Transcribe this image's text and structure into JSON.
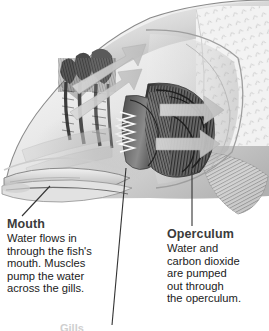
{
  "figure": {
    "background_color": "#ffffff",
    "width": 269,
    "height": 331
  },
  "illustration": {
    "description": "Grayscale cutaway drawing of a fish head showing the mouth, gill arches with filaments, operculum and pectoral fin, with pale arrows tracing water flow from the mouth across the gills and out behind the operculum.",
    "palette": {
      "outline": "#5e5e5e",
      "body_light": "#e9e9e9",
      "body_mid": "#b4b4b4",
      "body_shadow": "#6e6e6e",
      "gill_dark": "#3a3a3a",
      "gill_mid": "#7a7a7a",
      "arrow_fill": "#c9c9c9",
      "arrow_edge": "#a8a8a8",
      "leader_line": "#3c3c3c"
    },
    "parts": [
      "head-outline",
      "mouth-opening",
      "lower-jaw",
      "gill-rakers",
      "gill-arch-anterior",
      "gill-arch-posterior",
      "gill-filaments",
      "operculum-edge",
      "scale-texture",
      "pectoral-fin"
    ],
    "flow_arrows": [
      {
        "name": "inflow-arrow-upper",
        "direction": "up-right"
      },
      {
        "name": "inflow-arrow-lower",
        "direction": "up-right"
      },
      {
        "name": "across-gills-arrow",
        "direction": "right"
      },
      {
        "name": "outflow-arrow-upper",
        "direction": "right"
      },
      {
        "name": "outflow-arrow-lower",
        "direction": "right"
      }
    ]
  },
  "callouts": [
    {
      "id": "mouth",
      "title": "Mouth",
      "lines": [
        "Water flows in",
        "through the fish's",
        "mouth. Muscles",
        "pump the water",
        "across the gills."
      ]
    },
    {
      "id": "operculum",
      "title": "Operculum",
      "lines": [
        "Water and",
        "carbon dioxide",
        "are pumped",
        "out through",
        "the operculum."
      ]
    }
  ],
  "cropped_label": {
    "text": "Gills",
    "note": "clipped at bottom edge of image"
  },
  "leader_lines": [
    {
      "name": "leader-line-mouth",
      "from": "mouth-opening",
      "to": "callout-mouth"
    },
    {
      "name": "leader-line-gills",
      "from": "gill-filaments",
      "to": "cropped-bottom-label"
    },
    {
      "name": "leader-line-operculum",
      "from": "operculum-edge",
      "to": "callout-operculum"
    }
  ]
}
